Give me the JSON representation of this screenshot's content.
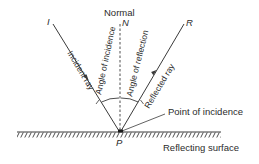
{
  "diagram": {
    "labels": {
      "normal": "Normal",
      "normal_point": "N",
      "incident_point": "I",
      "reflected_point": "R",
      "incidence_point": "P",
      "angle_of_incidence": "Angle of incidence",
      "angle_of_reflection": "Angle of reflection",
      "incident_ray": "Incident ray",
      "reflected_ray": "Reflected ray",
      "point_of_incidence": "Point of incidence",
      "reflecting_surface": "Reflecting surface"
    },
    "colors": {
      "line": "#3a3a3a",
      "text": "#2b2b2b",
      "background": "#ffffff"
    }
  }
}
